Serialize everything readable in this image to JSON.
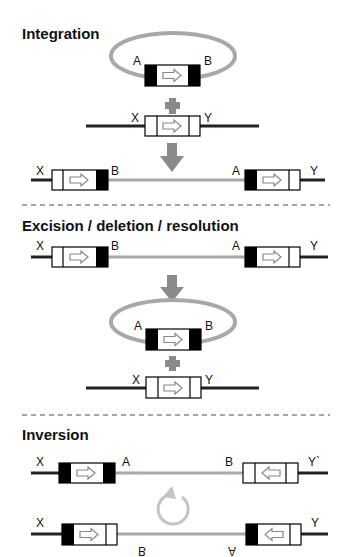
{
  "sections": {
    "integration": {
      "title": "Integration"
    },
    "excision": {
      "title": "Excision / deletion / resolution"
    },
    "inversion": {
      "title": "Inversion"
    }
  },
  "labels": {
    "A": "A",
    "B": "B",
    "X": "X",
    "Y": "Y",
    "Yprime": "Y`"
  },
  "colors": {
    "dna": "#222222",
    "plasmid": "#a8a8a8",
    "arrow": "#8a8a8a",
    "site_black": "#000000"
  }
}
